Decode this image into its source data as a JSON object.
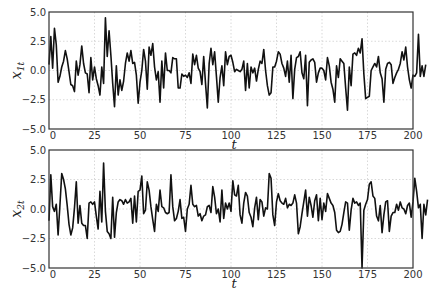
{
  "chart_data": [
    {
      "type": "line",
      "panel": "top",
      "title": "",
      "xlabel": "t",
      "ylabel": "x_{1t}",
      "ylabel_main": "x",
      "ylabel_sub": "1t",
      "xlim": [
        0,
        200
      ],
      "ylim": [
        -5.0,
        5.0
      ],
      "xticks": [
        "0",
        "25",
        "50",
        "75",
        "100",
        "125",
        "150",
        "175",
        "200"
      ],
      "yticks": [
        "5.0",
        "2.5",
        "0.0",
        "-2.5",
        "-5.0"
      ],
      "grid": true,
      "legend": null,
      "series": [
        {
          "name": "x1t",
          "x_start": 0,
          "x_step": 1,
          "values": [
            0.5,
            2.9,
            0.2,
            3.6,
            2.2,
            -1.0,
            -0.5,
            0.3,
            0.8,
            1.7,
            1.0,
            -0.1,
            -1.2,
            -1.3,
            -1.8,
            0.8,
            -0.4,
            0.5,
            2.1,
            0.6,
            -0.2,
            -0.3,
            -1.9,
            1.1,
            -0.8,
            0.3,
            -0.7,
            -1.3,
            -2.1,
            0.3,
            -1.1,
            4.5,
            1.2,
            3.4,
            1.3,
            -1.1,
            -3.1,
            0.4,
            -2.1,
            -0.8,
            -1.7,
            -0.9,
            0.6,
            1.5,
            0.8,
            1.7,
            0.6,
            0.7,
            -0.4,
            -2.8,
            -1.0,
            0.0,
            1.8,
            0.8,
            -1.6,
            2.0,
            1.3,
            2.3,
            0.3,
            -0.8,
            -0.1,
            -2.7,
            0.8,
            -1.5,
            1.5,
            0.0,
            0.0,
            -0.2,
            1.1,
            1.0,
            1.0,
            -1.5,
            -1.5,
            -0.3,
            -0.5,
            -0.4,
            -0.6,
            -0.2,
            -1.1,
            1.4,
            0.5,
            1.3,
            0.2,
            -0.1,
            -1.2,
            1.2,
            -1.1,
            -3.2,
            0.6,
            1.9,
            0.5,
            1.6,
            -0.5,
            -2.7,
            -0.6,
            0.4,
            -1.3,
            1.6,
            0.5,
            1.2,
            1.3,
            0.7,
            -0.1,
            0.1,
            0.0,
            -0.1,
            0.1,
            0.8,
            -1.7,
            0.6,
            -1.5,
            0.3,
            -0.2,
            0.2,
            -0.9,
            0.1,
            0.8,
            0.6,
            1.8,
            0.0,
            -1.3,
            -2.1,
            -1.9,
            0.3,
            0.3,
            0.8,
            1.6,
            1.4,
            0.6,
            0.2,
            -0.5,
            0.8,
            -1.0,
            1.3,
            -2.4,
            0.1,
            1.1,
            1.2,
            1.6,
            -0.2,
            -0.7,
            1.3,
            -3.0,
            0.7,
            0.9,
            1.0,
            0.7,
            -1.0,
            -0.2,
            0.2,
            0.2,
            0.0,
            -0.8,
            1.1,
            0.4,
            -1.0,
            -1.6,
            -2.7,
            0.4,
            -0.6,
            1.0,
            0.8,
            0.6,
            -1.5,
            -3.4,
            0.3,
            -1.3,
            1.4,
            1.5,
            1.3,
            1.9,
            1.5,
            2.7,
            -0.3,
            -2.4,
            -2.3,
            -2.2,
            0.0,
            0.3,
            0.6,
            0.3,
            1.2,
            -0.2,
            -0.7,
            -2.7,
            0.1,
            0.6,
            0.7,
            0.5,
            -1.1,
            -0.6,
            -0.2,
            0.1,
            0.6,
            1.6,
            0.9,
            2.0,
            0.3,
            -0.8,
            -1.5,
            -0.4,
            -0.5,
            -0.2,
            3.1,
            -0.5,
            0.4,
            -0.5,
            0.5
          ]
        }
      ]
    },
    {
      "type": "line",
      "panel": "bottom",
      "title": "",
      "xlabel": "t",
      "ylabel": "x_{2t}",
      "ylabel_main": "x",
      "ylabel_sub": "2t",
      "xlim": [
        0,
        200
      ],
      "ylim": [
        -5.0,
        5.0
      ],
      "xticks": [
        "0",
        "25",
        "50",
        "75",
        "100",
        "125",
        "150",
        "175",
        "200"
      ],
      "yticks": [
        "5.0",
        "2.5",
        "0.0",
        "-2.5",
        "-5.0"
      ],
      "grid": true,
      "legend": null,
      "series": [
        {
          "name": "x2t",
          "x_start": 0,
          "x_step": 1,
          "values": [
            -1.0,
            2.9,
            0.2,
            -0.2,
            0.4,
            -2.2,
            0.3,
            3.0,
            2.5,
            1.7,
            0.3,
            -1.3,
            -2.2,
            -1.6,
            0.1,
            2.3,
            -1.2,
            0.3,
            -1.2,
            -1.4,
            -1.4,
            -2.5,
            0.5,
            0.6,
            0.4,
            0.6,
            -0.6,
            -1.7,
            1.5,
            -1.1,
            3.9,
            -0.2,
            -1.9,
            -2.1,
            -2.5,
            1.0,
            -2.4,
            -0.3,
            0.6,
            0.8,
            0.7,
            0.4,
            0.8,
            0.5,
            0.6,
            0.9,
            -1.2,
            1.1,
            -1.1,
            1.5,
            1.6,
            2.8,
            -0.4,
            -0.1,
            2.3,
            1.6,
            0.2,
            -0.9,
            -1.9,
            0.4,
            -0.2,
            1.6,
            0.2,
            0.1,
            -0.3,
            -0.4,
            -0.3,
            2.9,
            0.2,
            -1.0,
            -0.8,
            -0.2,
            0.8,
            -0.8,
            -0.7,
            -1.9,
            0.0,
            0.4,
            2.0,
            0.4,
            0.2,
            0.3,
            -0.6,
            -0.4,
            -1.0,
            -0.6,
            -0.5,
            0.2,
            0.3,
            -0.3,
            1.9,
            1.0,
            -0.4,
            0.0,
            -1.1,
            1.6,
            -0.8,
            0.5,
            0.0,
            0.5,
            -0.2,
            2.4,
            1.2,
            1.1,
            2.0,
            -0.5,
            -1.2,
            0.5,
            1.4,
            1.1,
            -0.3,
            -0.7,
            -1.5,
            0.1,
            1.0,
            -0.9,
            0.8,
            0.6,
            -0.6,
            0.1,
            0.0,
            3.0,
            2.6,
            -0.5,
            -1.4,
            0.6,
            1.3,
            0.7,
            0.5,
            0.4,
            0.9,
            0.1,
            0.4,
            0.3,
            0.5,
            1.2,
            0.5,
            -2.1,
            -1.5,
            -0.4,
            0.6,
            1.6,
            -0.6,
            1.0,
            0.3,
            -0.7,
            0.7,
            1.2,
            -1.0,
            0.9,
            -0.9,
            0.5,
            -0.2,
            1.3,
            0.9,
            0.5,
            0.3,
            -0.3,
            -1.8,
            -2.0,
            -1.9,
            -1.3,
            -0.3,
            0.6,
            0.5,
            -1.8,
            -0.1,
            0.9,
            0.5,
            0.6,
            0.3,
            0.5,
            -5.0,
            -0.1,
            0.4,
            0.8,
            2.1,
            2.3,
            1.1,
            0.9,
            -0.6,
            -1.0,
            0.3,
            -2.0,
            -0.5,
            0.6,
            0.7,
            -1.9,
            -0.6,
            -0.3,
            -0.3,
            0.4,
            -0.1,
            0.6,
            0.1,
            0.0,
            -0.4,
            0.3,
            0.5,
            -0.7,
            0.6,
            2.6,
            1.5,
            0.1,
            0.4,
            -2.5,
            0.4,
            -0.5,
            0.8
          ]
        }
      ]
    }
  ]
}
